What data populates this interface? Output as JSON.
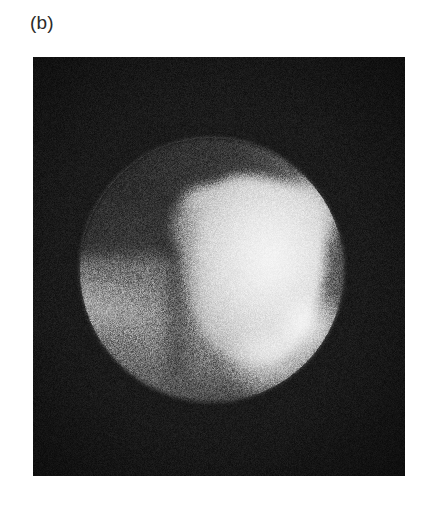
{
  "figure": {
    "panel_label": "(b)",
    "modality": "planar scintigraphy / gamma-camera image",
    "background_color": "#ffffff"
  },
  "scan_panel": {
    "name": "nuclear-medicine-scan",
    "x": 33,
    "y": 57,
    "width": 372,
    "height": 419,
    "background_color": "#141414",
    "grain": "high-frequency monochrome noise"
  },
  "chart_data": {
    "type": "heatmap",
    "title": "(b)",
    "xlabel": "",
    "ylabel": "",
    "colormap": "grayscale",
    "value_range": [
      0,
      255
    ],
    "grid": false,
    "legend": "none",
    "field_of_view": {
      "shape": "circle",
      "center_x": 212,
      "center_y": 270,
      "radius": 132,
      "mean_intensity": 112
    },
    "regions": [
      {
        "name": "background-outside-fov",
        "description": "near-black noisy detector background surrounding the circular field of view",
        "intensity": 22,
        "color": "#161616"
      },
      {
        "name": "upper-left-low-uptake",
        "description": "dark grey low-count region in the upper-left quadrant of the field of view",
        "intensity": 68,
        "color": "#444444"
      },
      {
        "name": "lower-left-soft-tissue-band",
        "description": "mid-grey horizontal plateau across the lower-left of the field of view",
        "intensity": 140,
        "color": "#8c8c8c"
      },
      {
        "name": "hot-uptake-lobe",
        "description": "bright heart-shaped high-uptake lesion occupying the right-centre of the field of view",
        "intensity": 236,
        "color": "#ececec",
        "bounds": {
          "x": 180,
          "y": 175,
          "width": 146,
          "height": 190
        }
      },
      {
        "name": "hot-uptake-core",
        "description": "brightest near-saturated core of the uptake region",
        "intensity": 250,
        "color": "#fafafa",
        "center_x": 280,
        "center_y": 268
      },
      {
        "name": "apex-fade",
        "description": "darker crease where the hot region tapers toward the inferior border",
        "intensity": 92,
        "color": "#5c5c5c"
      }
    ]
  }
}
